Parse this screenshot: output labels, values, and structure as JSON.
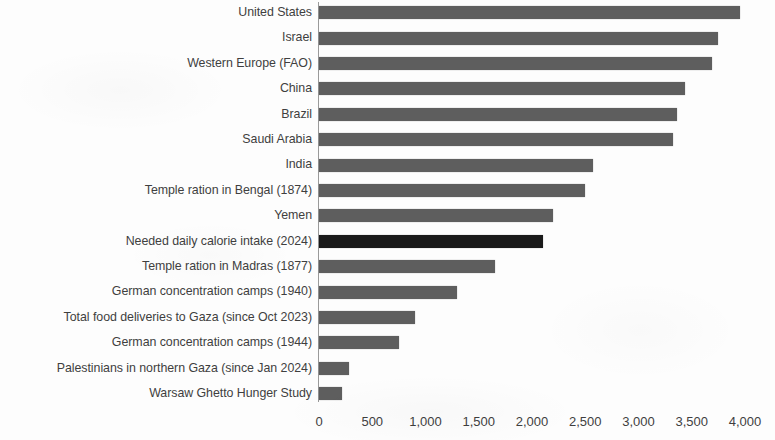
{
  "chart_data": {
    "type": "bar",
    "orientation": "horizontal",
    "title": "",
    "subtitle": "",
    "xlabel": "",
    "ylabel": "",
    "xlim": [
      0,
      4000
    ],
    "xticks": [
      0,
      500,
      1000,
      1500,
      2000,
      2500,
      3000,
      3500,
      4000
    ],
    "xtick_labels": [
      "0",
      "500",
      "1,000",
      "1,500",
      "2,000",
      "2,500",
      "3,000",
      "3,500",
      "4,000"
    ],
    "grid": false,
    "legend": null,
    "bar_color": "#5e5e5e",
    "highlight_color": "#1a1a1a",
    "categories": [
      "United States",
      "Israel",
      "Western Europe (FAO)",
      "China",
      "Brazil",
      "Saudi Arabia",
      "India",
      "Temple ration in Bengal (1874)",
      "Yemen",
      "Needed daily calorie intake (2024)",
      "Temple ration in Madras (1877)",
      "German concentration camps (1940)",
      "Total food deliveries to Gaza (since Oct 2023)",
      "German concentration camps (1944)",
      "Palestinians in northern Gaza (since Jan 2024)",
      "Warsaw Ghetto Hunger Study"
    ],
    "values": [
      3950,
      3750,
      3690,
      3440,
      3360,
      3320,
      2570,
      2500,
      2200,
      2100,
      1650,
      1300,
      900,
      750,
      280,
      220
    ],
    "highlighted": [
      false,
      false,
      false,
      false,
      false,
      false,
      false,
      false,
      false,
      true,
      false,
      false,
      false,
      false,
      false,
      false
    ]
  },
  "bars": [
    {
      "label": "United States",
      "value": 3950,
      "highlight": false
    },
    {
      "label": "Israel",
      "value": 3750,
      "highlight": false
    },
    {
      "label": "Western Europe (FAO)",
      "value": 3690,
      "highlight": false
    },
    {
      "label": "China",
      "value": 3440,
      "highlight": false
    },
    {
      "label": "Brazil",
      "value": 3360,
      "highlight": false
    },
    {
      "label": "Saudi Arabia",
      "value": 3320,
      "highlight": false
    },
    {
      "label": "India",
      "value": 2570,
      "highlight": false
    },
    {
      "label": "Temple ration in Bengal (1874)",
      "value": 2500,
      "highlight": false
    },
    {
      "label": "Yemen",
      "value": 2200,
      "highlight": false
    },
    {
      "label": "Needed daily calorie intake (2024)",
      "value": 2100,
      "highlight": true
    },
    {
      "label": "Temple ration in Madras (1877)",
      "value": 1650,
      "highlight": false
    },
    {
      "label": "German concentration camps (1940)",
      "value": 1300,
      "highlight": false
    },
    {
      "label": "Total food deliveries to Gaza (since Oct 2023)",
      "value": 900,
      "highlight": false
    },
    {
      "label": "German concentration camps (1944)",
      "value": 750,
      "highlight": false
    },
    {
      "label": "Palestinians in northern Gaza (since Jan 2024)",
      "value": 280,
      "highlight": false
    },
    {
      "label": "Warsaw Ghetto Hunger Study",
      "value": 220,
      "highlight": false
    }
  ],
  "axis": {
    "ticks": [
      "0",
      "500",
      "1,000",
      "1,500",
      "2,000",
      "2,500",
      "3,000",
      "3,500",
      "4,000"
    ]
  }
}
